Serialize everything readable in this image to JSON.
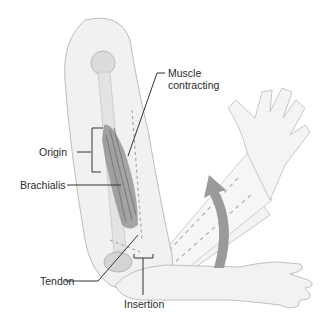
{
  "diagram": {
    "labels": {
      "muscle_contracting_line1": "Muscle",
      "muscle_contracting_line2": "contracting",
      "origin": "Origin",
      "brachialis": "Brachialis",
      "tendon": "Tendon",
      "insertion": "Insertion"
    },
    "colors": {
      "skin_fill": "#f1f1f1",
      "skin_outline": "#bdbdbd",
      "muscle": "#8a8a8a",
      "bone": "#dcdcdc",
      "dashes": "#a8a8a8",
      "arrow": "#9a9a9a",
      "leader_lines": "#333333"
    }
  }
}
